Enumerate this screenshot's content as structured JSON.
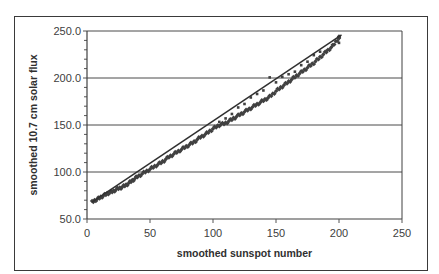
{
  "chart_data": {
    "type": "scatter",
    "title": "",
    "xlabel": "smoothed sunspot number",
    "ylabel": "smoothed 10.7 cm solar flux",
    "xlim": [
      0,
      250
    ],
    "ylim": [
      50,
      250
    ],
    "x_ticks": [
      "0",
      "50",
      "100",
      "150",
      "200",
      "250"
    ],
    "y_ticks": [
      "50.0",
      "100.0",
      "150.0",
      "200.0",
      "250.0"
    ],
    "grid": {
      "horizontal": true,
      "vertical": false
    },
    "legend": null,
    "series": [
      {
        "name": "observed",
        "marker": "diamond",
        "color": "#404040",
        "x": [
          4,
          8,
          12,
          16,
          20,
          24,
          28,
          32,
          36,
          40,
          45,
          50,
          55,
          60,
          65,
          70,
          75,
          80,
          85,
          90,
          95,
          100,
          105,
          110,
          115,
          120,
          125,
          130,
          135,
          140,
          145,
          150,
          155,
          160,
          165,
          170,
          175,
          180,
          185,
          190,
          195,
          200
        ],
        "y": [
          68,
          71,
          74,
          77,
          79,
          82,
          84,
          87,
          91,
          95,
          99,
          103,
          107,
          111,
          116,
          120,
          124,
          128,
          132,
          137,
          141,
          146,
          150,
          152,
          156,
          160,
          164,
          168,
          172,
          176,
          180,
          186,
          191,
          196,
          201,
          206,
          211,
          216,
          222,
          228,
          234,
          243
        ]
      },
      {
        "name": "offset points",
        "marker": "dot",
        "color": "#404040",
        "x": [
          105,
          110,
          115,
          120,
          125,
          130,
          135,
          140,
          145,
          150,
          155,
          160,
          165,
          170,
          175,
          180,
          185,
          190,
          195,
          200
        ],
        "y": [
          152,
          157,
          163,
          168,
          173,
          178,
          183,
          188,
          200,
          196,
          200,
          204,
          208,
          213,
          218,
          223,
          228,
          230,
          234,
          238
        ]
      },
      {
        "name": "fit",
        "type": "line",
        "color": "#303030",
        "x": [
          4,
          202
        ],
        "y": [
          68,
          246
        ]
      }
    ]
  }
}
